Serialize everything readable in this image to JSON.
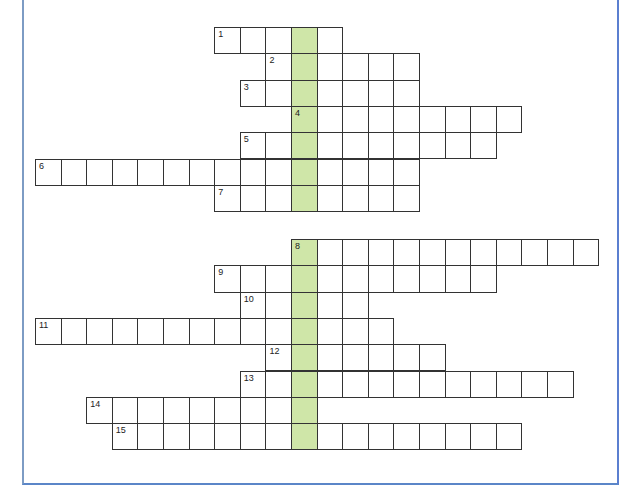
{
  "puzzle": {
    "type": "crossword",
    "highlight_color": "#cfe6a8",
    "frame_color": "#5b86c8",
    "cell_size": 25.6,
    "row_height": 26.3,
    "key_column_x": 291,
    "sections": [
      {
        "name": "top",
        "start_y": 27,
        "rows": [
          {
            "clue": "1",
            "from": -3,
            "to": 1
          },
          {
            "clue": "2",
            "from": -1,
            "to": 4
          },
          {
            "clue": "3",
            "from": -2,
            "to": 4
          },
          {
            "clue": "4",
            "from": 0,
            "to": 8
          },
          {
            "clue": "5",
            "from": -2,
            "to": 7
          },
          {
            "clue": "6",
            "from": -10,
            "to": 4
          },
          {
            "clue": "7",
            "from": -3,
            "to": 4
          }
        ]
      },
      {
        "name": "bottom",
        "start_y": 239,
        "rows": [
          {
            "clue": "8",
            "from": 0,
            "to": 11
          },
          {
            "clue": "9",
            "from": -3,
            "to": 7
          },
          {
            "clue": "10",
            "from": -2,
            "to": 2
          },
          {
            "clue": "11",
            "from": -10,
            "to": 3
          },
          {
            "clue": "12",
            "from": -1,
            "to": 5
          },
          {
            "clue": "13",
            "from": -2,
            "to": 10
          },
          {
            "clue": "14",
            "from": -8,
            "to": 0
          },
          {
            "clue": "15",
            "from": -7,
            "to": 8
          }
        ]
      }
    ]
  }
}
